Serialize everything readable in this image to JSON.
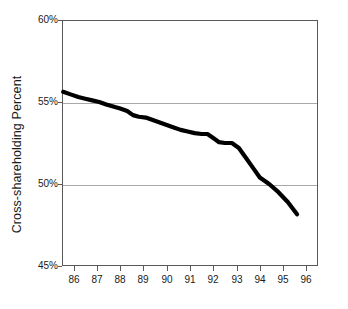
{
  "chart_data": {
    "type": "line",
    "title": "",
    "subtitle": "",
    "xlabel": "",
    "ylabel": "Cross-shareholding Percent",
    "xlim": [
      85.5,
      96.5
    ],
    "ylim": [
      45,
      60
    ],
    "grid": "horizontal gridlines at 50% and 55% only",
    "legend": "none",
    "line_color": "#000000",
    "line_width_px": 4.2,
    "x_tick_labels": [
      "86",
      "87",
      "88",
      "89",
      "90",
      "91",
      "92",
      "93",
      "94",
      "95",
      "96"
    ],
    "y_tick_labels": [
      "45%",
      "50%",
      "55%",
      "60%"
    ],
    "y_tick_values": [
      45,
      50,
      55,
      60
    ],
    "x": [
      85.55,
      85.9,
      86.2,
      86.5,
      86.8,
      87.1,
      87.4,
      87.7,
      88.0,
      88.3,
      88.55,
      88.8,
      89.1,
      89.4,
      89.7,
      90.0,
      90.3,
      90.6,
      90.9,
      91.2,
      91.5,
      91.75,
      92.0,
      92.25,
      92.5,
      92.8,
      93.1,
      93.4,
      93.7,
      94.0,
      94.4,
      94.8,
      95.2,
      95.6
    ],
    "y": [
      55.62,
      55.45,
      55.3,
      55.2,
      55.1,
      55.0,
      54.85,
      54.72,
      54.6,
      54.45,
      54.2,
      54.1,
      54.05,
      53.9,
      53.75,
      53.6,
      53.45,
      53.3,
      53.2,
      53.1,
      53.05,
      53.05,
      52.8,
      52.55,
      52.5,
      52.5,
      52.2,
      51.6,
      51.0,
      50.4,
      50.0,
      49.5,
      48.9,
      48.15
    ],
    "series": [
      {
        "name": "Cross-shareholding Percent",
        "values": [
          55.62,
          55.45,
          55.3,
          55.2,
          55.1,
          55.0,
          54.85,
          54.72,
          54.6,
          54.45,
          54.2,
          54.1,
          54.05,
          53.9,
          53.75,
          53.6,
          53.45,
          53.3,
          53.2,
          53.1,
          53.05,
          53.05,
          52.8,
          52.55,
          52.5,
          52.5,
          52.2,
          51.6,
          51.0,
          50.4,
          50.0,
          49.5,
          48.9,
          48.15
        ]
      }
    ],
    "yearly_values": {
      "86": 55.5,
      "87": 55.05,
      "88": 54.6,
      "89": 54.05,
      "90": 53.6,
      "91": 53.15,
      "92": 52.8,
      "93": 52.2,
      "94": 50.4,
      "95": 49.2,
      "96": 48.15
    }
  },
  "axes": {
    "ylabel": "Cross-shareholding Percent",
    "yticks": [
      {
        "label": "60%",
        "value": 60
      },
      {
        "label": "55%",
        "value": 55
      },
      {
        "label": "50%",
        "value": 50
      },
      {
        "label": "45%",
        "value": 45
      }
    ],
    "xticks": [
      {
        "label": "86",
        "value": 86
      },
      {
        "label": "87",
        "value": 87
      },
      {
        "label": "88",
        "value": 88
      },
      {
        "label": "89",
        "value": 89
      },
      {
        "label": "90",
        "value": 90
      },
      {
        "label": "91",
        "value": 91
      },
      {
        "label": "92",
        "value": 92
      },
      {
        "label": "93",
        "value": 93
      },
      {
        "label": "94",
        "value": 94
      },
      {
        "label": "95",
        "value": 95
      },
      {
        "label": "96",
        "value": 96
      }
    ]
  },
  "colors": {
    "line": "#000000",
    "grid": "#a9a9ab",
    "frame": "#59595b",
    "text": "#1a1a1a",
    "background": "#ffffff"
  }
}
